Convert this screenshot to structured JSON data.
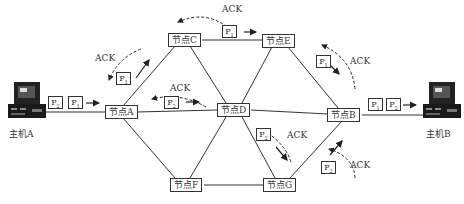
{
  "hosts": [
    {
      "id": "A",
      "label": "主机A"
    },
    {
      "id": "B",
      "label": "主机B"
    }
  ],
  "nodes": [
    {
      "id": "A",
      "label": "节点A"
    },
    {
      "id": "B",
      "label": "节点B"
    },
    {
      "id": "C",
      "label": "节点C"
    },
    {
      "id": "D",
      "label": "节点D"
    },
    {
      "id": "E",
      "label": "节点E"
    },
    {
      "id": "F",
      "label": "节点F"
    },
    {
      "id": "G",
      "label": "节点G"
    }
  ],
  "links": [
    [
      "主机A",
      "节点A"
    ],
    [
      "节点A",
      "节点C"
    ],
    [
      "节点A",
      "节点D"
    ],
    [
      "节点A",
      "节点F"
    ],
    [
      "节点C",
      "节点E"
    ],
    [
      "节点C",
      "节点D"
    ],
    [
      "节点E",
      "节点D"
    ],
    [
      "节点E",
      "节点B"
    ],
    [
      "节点D",
      "节点B"
    ],
    [
      "节点D",
      "节点F"
    ],
    [
      "节点D",
      "节点G"
    ],
    [
      "节点F",
      "节点G"
    ],
    [
      "节点G",
      "节点B"
    ],
    [
      "节点B",
      "主机B"
    ]
  ],
  "packets": {
    "p1": "P",
    "p2": "P",
    "sub1": "1",
    "sub2": "2"
  },
  "ack_label": "ACK"
}
